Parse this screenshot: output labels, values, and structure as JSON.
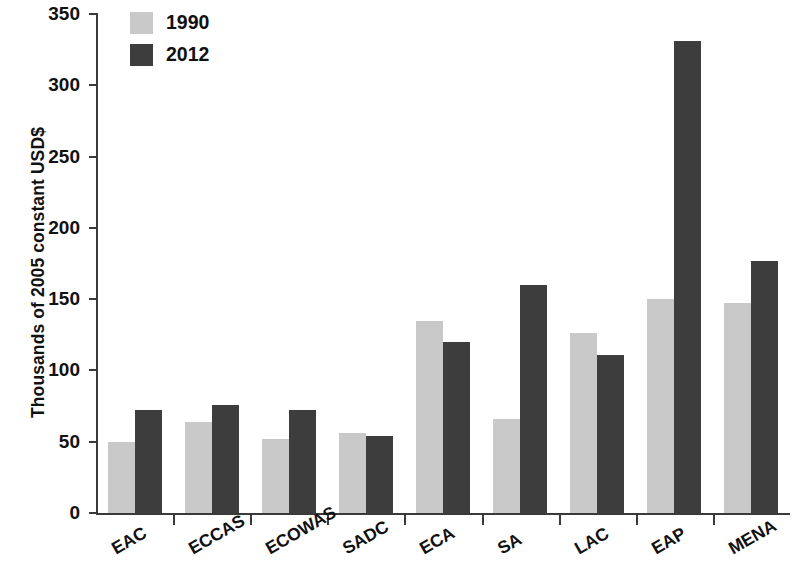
{
  "chart_data": {
    "type": "bar",
    "title": "",
    "subtitle": "",
    "xlabel": "",
    "ylabel": "Thousands of 2005 constant USD$",
    "ylim": [
      0,
      350
    ],
    "ytick_values": [
      0,
      50,
      100,
      150,
      200,
      250,
      300,
      350
    ],
    "ytick_labels": [
      "0",
      "50",
      "100",
      "150",
      "200",
      "250",
      "300",
      "350"
    ],
    "grid": false,
    "legend_position": "top-left",
    "categories": [
      "EAC",
      "ECCAS",
      "ECOWAS",
      "SADC",
      "ECA",
      "SA",
      "LAC",
      "EAP",
      "MENA"
    ],
    "series": [
      {
        "name": "1990",
        "color": "#c9c9c9",
        "values": [
          50,
          64,
          52,
          56,
          135,
          66,
          126,
          150,
          147
        ]
      },
      {
        "name": "2012",
        "color": "#3d3d3d",
        "values": [
          72,
          76,
          72,
          54,
          120,
          160,
          111,
          331,
          177
        ]
      }
    ]
  },
  "legend": {
    "items": [
      {
        "label": "1990",
        "swatch": "light-gray-swatch"
      },
      {
        "label": "2012",
        "swatch": "dark-gray-swatch"
      }
    ]
  },
  "colors": {
    "series_1990": "#c9c9c9",
    "series_2012": "#3d3d3d",
    "axis": "#3a3a3a",
    "text": "#111111",
    "background": "#ffffff"
  }
}
